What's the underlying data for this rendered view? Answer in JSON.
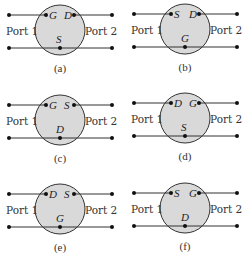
{
  "diagram": {
    "port_left_label": "Port 1",
    "port_right_label": "Port 2",
    "colors": {
      "circle_fill": "#d9d9d9",
      "stroke": "#333333",
      "dot": "#111111"
    },
    "panels": [
      {
        "caption": "(a)",
        "top_left": "G",
        "top_right": "D",
        "bottom": "S"
      },
      {
        "caption": "(b)",
        "top_left": "S",
        "top_right": "D",
        "bottom": "G"
      },
      {
        "caption": "(c)",
        "top_left": "G",
        "top_right": "S",
        "bottom": "D"
      },
      {
        "caption": "(d)",
        "top_left": "D",
        "top_right": "G",
        "bottom": "S"
      },
      {
        "caption": "(e)",
        "top_left": "D",
        "top_right": "S",
        "bottom": "G"
      },
      {
        "caption": "(f)",
        "top_left": "S",
        "top_right": "G",
        "bottom": "D"
      }
    ]
  }
}
